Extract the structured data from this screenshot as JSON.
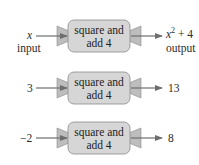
{
  "diagram": {
    "type": "function-machine",
    "colors": {
      "box_fill": "#d6d6d6",
      "box_border": "#8a8a8a",
      "funnel_fill": "#bdbdbd",
      "arrow": "#6e6e6e"
    },
    "machines": [
      {
        "input": "x",
        "input_label": "input",
        "box_line1": "square and",
        "box_line2": "add 4",
        "output_base": "x",
        "output_exp": "2",
        "output_rest": " + 4",
        "output_label": "output"
      },
      {
        "input": "3",
        "box_line1": "square and",
        "box_line2": "add 4",
        "output": "13"
      },
      {
        "input": "−2",
        "box_line1": "square and",
        "box_line2": "add 4",
        "output": "8"
      }
    ]
  }
}
